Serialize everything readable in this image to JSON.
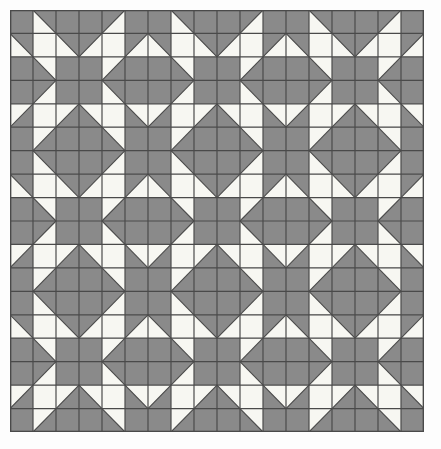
{
  "figure": {
    "kind": "geometric-pattern",
    "width": 441,
    "height": 449
  },
  "chart_data": {
    "type": "heatmap",
    "xlabel": "",
    "ylabel": "",
    "grid": true,
    "legend": null,
    "pattern": {
      "grid_columns": 18,
      "grid_rows": 18,
      "block_columns": 3,
      "block_rows": 3,
      "block_size": 6,
      "cell_width": 23,
      "cell_height": 23.44,
      "origin_x": 10,
      "origin_y": 10,
      "plot_width": 414,
      "plot_height": 422
    },
    "colors": {
      "dark": "#8a8a8a",
      "light": "#f7f7f2",
      "gridline": "#4a4a4a",
      "background": "#fdfdfd",
      "outer_border": "#4a4a4a"
    },
    "cell_codes": {
      "D": "solid dark",
      "L": "solid light",
      "TL": "light triangle in top-left corner, dark remainder",
      "TR": "light triangle in top-right corner, dark remainder",
      "BL": "light triangle in bottom-left corner, dark remainder",
      "BR": "light triangle in bottom-right corner, dark remainder"
    },
    "block": [
      [
        "D",
        "BL",
        "D",
        "D",
        "BR",
        "D"
      ],
      [
        "BL",
        "L",
        "BL",
        "BR",
        "L",
        "BR"
      ],
      [
        "D",
        "TR",
        "D",
        "D",
        "TL",
        "D"
      ],
      [
        "D",
        "BR",
        "D",
        "D",
        "BL",
        "D"
      ],
      [
        "TL",
        "L",
        "TL",
        "TR",
        "L",
        "TR"
      ],
      [
        "D",
        "TL",
        "D",
        "D",
        "TR",
        "D"
      ]
    ],
    "categories": [
      "c1",
      "c2",
      "c3",
      "c4",
      "c5",
      "c6",
      "c7",
      "c8",
      "c9",
      "c10",
      "c11",
      "c12",
      "c13",
      "c14",
      "c15",
      "c16",
      "c17",
      "c18"
    ],
    "values": [
      [
        "D",
        "BL",
        "D",
        "D",
        "BR",
        "D",
        "D",
        "BL",
        "D",
        "D",
        "BR",
        "D",
        "D",
        "BL",
        "D",
        "D",
        "BR",
        "D"
      ],
      [
        "BL",
        "L",
        "BL",
        "BR",
        "L",
        "BR",
        "BL",
        "L",
        "BL",
        "BR",
        "L",
        "BR",
        "BL",
        "L",
        "BL",
        "BR",
        "L",
        "BR"
      ],
      [
        "D",
        "TR",
        "D",
        "D",
        "TL",
        "D",
        "D",
        "TR",
        "D",
        "D",
        "TL",
        "D",
        "D",
        "TR",
        "D",
        "D",
        "TL",
        "D"
      ],
      [
        "D",
        "BR",
        "D",
        "D",
        "BL",
        "D",
        "D",
        "BR",
        "D",
        "D",
        "BL",
        "D",
        "D",
        "BR",
        "D",
        "D",
        "BL",
        "D"
      ],
      [
        "TL",
        "L",
        "TL",
        "TR",
        "L",
        "TR",
        "TL",
        "L",
        "TL",
        "TR",
        "L",
        "TR",
        "TL",
        "L",
        "TL",
        "TR",
        "L",
        "TR"
      ],
      [
        "D",
        "TL",
        "D",
        "D",
        "TR",
        "D",
        "D",
        "TL",
        "D",
        "D",
        "TR",
        "D",
        "D",
        "TL",
        "D",
        "D",
        "TR",
        "D"
      ],
      [
        "D",
        "BL",
        "D",
        "D",
        "BR",
        "D",
        "D",
        "BL",
        "D",
        "D",
        "BR",
        "D",
        "D",
        "BL",
        "D",
        "D",
        "BR",
        "D"
      ],
      [
        "BL",
        "L",
        "BL",
        "BR",
        "L",
        "BR",
        "BL",
        "L",
        "BL",
        "BR",
        "L",
        "BR",
        "BL",
        "L",
        "BL",
        "BR",
        "L",
        "BR"
      ],
      [
        "D",
        "TR",
        "D",
        "D",
        "TL",
        "D",
        "D",
        "TR",
        "D",
        "D",
        "TL",
        "D",
        "D",
        "TR",
        "D",
        "D",
        "TL",
        "D"
      ],
      [
        "D",
        "BR",
        "D",
        "D",
        "BL",
        "D",
        "D",
        "BR",
        "D",
        "D",
        "BL",
        "D",
        "D",
        "BR",
        "D",
        "D",
        "BL",
        "D"
      ],
      [
        "TL",
        "L",
        "TL",
        "TR",
        "L",
        "TR",
        "TL",
        "L",
        "TL",
        "TR",
        "L",
        "TR",
        "TL",
        "L",
        "TL",
        "TR",
        "L",
        "TR"
      ],
      [
        "D",
        "TL",
        "D",
        "D",
        "TR",
        "D",
        "D",
        "TL",
        "D",
        "D",
        "TR",
        "D",
        "D",
        "TL",
        "D",
        "D",
        "TR",
        "D"
      ],
      [
        "D",
        "BL",
        "D",
        "D",
        "BR",
        "D",
        "D",
        "BL",
        "D",
        "D",
        "BR",
        "D",
        "D",
        "BL",
        "D",
        "D",
        "BR",
        "D"
      ],
      [
        "BL",
        "L",
        "BL",
        "BR",
        "L",
        "BR",
        "BL",
        "L",
        "BL",
        "BR",
        "L",
        "BR",
        "BL",
        "L",
        "BL",
        "BR",
        "L",
        "BR"
      ],
      [
        "D",
        "TR",
        "D",
        "D",
        "TL",
        "D",
        "D",
        "TR",
        "D",
        "D",
        "TL",
        "D",
        "D",
        "TR",
        "D",
        "D",
        "TL",
        "D"
      ],
      [
        "D",
        "BR",
        "D",
        "D",
        "BL",
        "D",
        "D",
        "BR",
        "D",
        "D",
        "BL",
        "D",
        "D",
        "BR",
        "D",
        "D",
        "BL",
        "D"
      ],
      [
        "TL",
        "L",
        "TL",
        "TR",
        "L",
        "TR",
        "TL",
        "L",
        "TL",
        "TR",
        "L",
        "TR",
        "TL",
        "L",
        "TL",
        "TR",
        "L",
        "TR"
      ],
      [
        "D",
        "TL",
        "D",
        "D",
        "TR",
        "D",
        "D",
        "TL",
        "D",
        "D",
        "TR",
        "D",
        "D",
        "TL",
        "D",
        "D",
        "TR",
        "D"
      ]
    ]
  }
}
